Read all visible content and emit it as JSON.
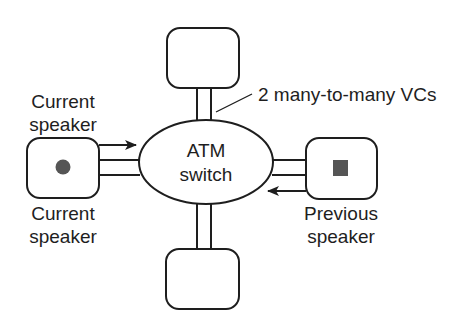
{
  "diagram": {
    "switch": {
      "line1": "ATM",
      "line2": "switch"
    },
    "annotation": "2 many-to-many VCs",
    "nodes": {
      "top": {
        "label": ""
      },
      "bottom": {
        "label": ""
      },
      "left": {
        "label_above": {
          "line1": "Current",
          "line2": "speaker"
        },
        "label_below": {
          "line1": "Current",
          "line2": "speaker"
        },
        "marker": "circle"
      },
      "right": {
        "label_below": {
          "line1": "Previous",
          "line2": "speaker"
        },
        "marker": "square"
      }
    },
    "colors": {
      "stroke": "#1e1e1e",
      "marker": "#555555",
      "background": "#ffffff"
    }
  }
}
